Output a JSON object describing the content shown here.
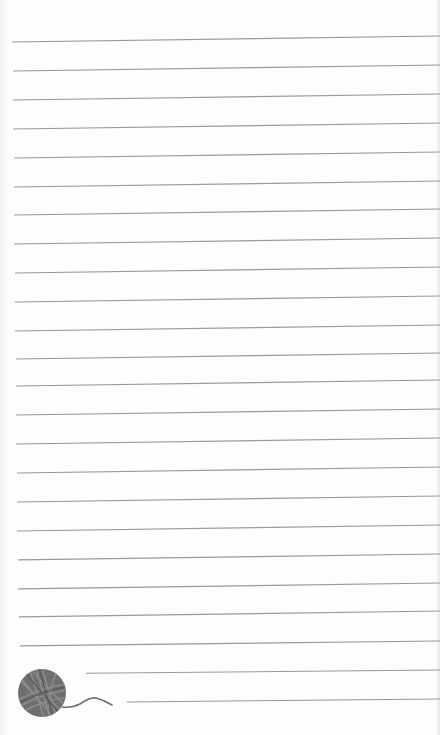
{
  "page": {
    "type": "lined-notepaper",
    "background_color": "#fdfdfd",
    "line_color": "#9a9a9a",
    "line_count": 23
  },
  "lines": [
    {
      "y_left": 42,
      "y_right": 36,
      "x_start": 12
    },
    {
      "y_left": 71,
      "y_right": 65,
      "x_start": 13
    },
    {
      "y_left": 100,
      "y_right": 94,
      "x_start": 13
    },
    {
      "y_left": 129,
      "y_right": 123,
      "x_start": 13
    },
    {
      "y_left": 158,
      "y_right": 152,
      "x_start": 14
    },
    {
      "y_left": 187,
      "y_right": 181,
      "x_start": 14
    },
    {
      "y_left": 215,
      "y_right": 209,
      "x_start": 14
    },
    {
      "y_left": 244,
      "y_right": 238,
      "x_start": 14
    },
    {
      "y_left": 273,
      "y_right": 267,
      "x_start": 15
    },
    {
      "y_left": 302,
      "y_right": 296,
      "x_start": 15
    },
    {
      "y_left": 331,
      "y_right": 325,
      "x_start": 15
    },
    {
      "y_left": 359,
      "y_right": 353,
      "x_start": 16
    },
    {
      "y_left": 386,
      "y_right": 380,
      "x_start": 16
    },
    {
      "y_left": 415,
      "y_right": 409,
      "x_start": 16
    },
    {
      "y_left": 444,
      "y_right": 438,
      "x_start": 16
    },
    {
      "y_left": 473,
      "y_right": 467,
      "x_start": 17
    },
    {
      "y_left": 502,
      "y_right": 496,
      "x_start": 17
    },
    {
      "y_left": 531,
      "y_right": 525,
      "x_start": 17
    },
    {
      "y_left": 560,
      "y_right": 554,
      "x_start": 18
    },
    {
      "y_left": 589,
      "y_right": 583,
      "x_start": 18
    },
    {
      "y_left": 617,
      "y_right": 611,
      "x_start": 19
    },
    {
      "y_left": 646,
      "y_right": 641,
      "x_start": 20
    },
    {
      "y_left": 674,
      "y_right": 670,
      "x_start": 86
    },
    {
      "y_left": 703,
      "y_right": 699,
      "x_start": 127
    }
  ],
  "decoration": {
    "icon": "yarn-ball-icon",
    "color": "#6e6e6e",
    "center_x": 42,
    "center_y": 693,
    "radius": 24
  }
}
